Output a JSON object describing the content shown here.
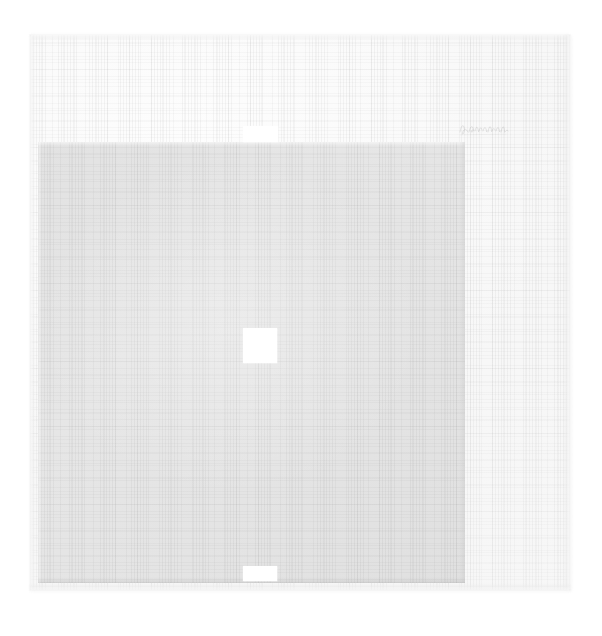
{
  "artwork": {
    "title": "Untitled minimalist print",
    "medium_appearance": "printed pale grey square on textured handmade paper",
    "background_color": "#ffffff",
    "paper": {
      "name": "paper-sheet",
      "color": "#fafafa",
      "texture": "laid-woven",
      "edge": "deckled",
      "bounds": {
        "x": 30,
        "y": 35,
        "width": 540,
        "height": 555
      }
    },
    "printed_block": {
      "name": "gray-square",
      "color": "#e4e4e4",
      "shape": "square",
      "bounds": {
        "x": 38,
        "y": 142,
        "width": 427,
        "height": 441
      }
    },
    "reserves": [
      {
        "name": "reserve-top",
        "color": "#ffffff",
        "shape": "rectangle",
        "bounds": {
          "x": 243,
          "y": 126,
          "width": 35,
          "height": 16
        }
      },
      {
        "name": "reserve-center",
        "color": "#ffffff",
        "shape": "square",
        "bounds": {
          "x": 243,
          "y": 328,
          "width": 34,
          "height": 35
        }
      },
      {
        "name": "reserve-bottom",
        "color": "#ffffff",
        "shape": "rectangle",
        "bounds": {
          "x": 243,
          "y": 566,
          "width": 34,
          "height": 15
        }
      }
    ],
    "inscription": {
      "name": "pencil-signature",
      "text": "",
      "legibility": "illegible",
      "tool": "graphite pencil",
      "position": "upper-right of sheet",
      "bounds": {
        "x": 458,
        "y": 119,
        "width": 52,
        "height": 20
      }
    }
  },
  "canvas": {
    "width": 602,
    "height": 636
  }
}
